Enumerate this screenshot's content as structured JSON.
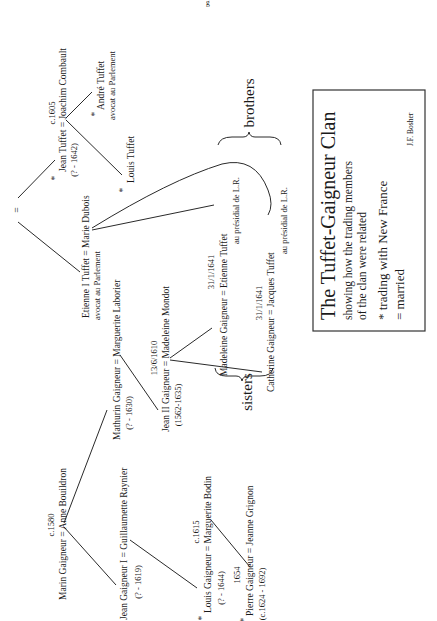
{
  "page_marker": "g",
  "legend": {
    "title": "The Tuffet-Gaigneur Clan",
    "subtitle_line1": "showing how the trading members",
    "subtitle_line2": "of the clan were related",
    "key_trading": "* trading with New France",
    "key_married": "= married",
    "author": "J.F. Bosher"
  },
  "symbols": {
    "marriage_equals": "=",
    "trader_star": "*"
  },
  "brackets": {
    "brothers": "brothers",
    "sisters": "sisters"
  },
  "people": {
    "jean_tuffet": {
      "date": "c.1605",
      "name": "Jean Tuffet = Joachim Combault",
      "dates": "(? - 1642)"
    },
    "andre_tuffet": {
      "name": "André Tuffet",
      "role": "avocat au Parlement"
    },
    "louis_tuffet": {
      "name": "Louis Tuffet"
    },
    "etienne_i_tuffet": {
      "name": "Etienne I Tuffet = Marie Dubois",
      "role": "avocat au Parlement"
    },
    "mathurin_gaigneur": {
      "name": "Mathurin Gaigneur = Marguerite Laborier",
      "dates": "(? - 1630)"
    },
    "jean_ii_gaigneur": {
      "date": "13/6/1610",
      "name": "Jean II Gaigneur = Madeleine Mondot",
      "dates": "(1562-1635)"
    },
    "madeleine_gaigneur": {
      "date": "31/1/1641",
      "name": "Madeleine Gaigneur = Etienne Tuffet",
      "role": "au présidial de L.R."
    },
    "catherine_gaigneur": {
      "date": "31/1/1641",
      "name": "Catherine Gaigneur = Jacques Tuffet",
      "role": "au présidial de L.R."
    },
    "marin_gaigneur": {
      "date": "c.1580",
      "name": "Marin Gaigneur = Anne Bouildron"
    },
    "jean_gaigneur_i": {
      "name": "Jean Gaigneur I = Guillaumette Raynier",
      "dates": "(? - 1619)"
    },
    "louis_gaigneur": {
      "date": "c.1615",
      "name": "Louis Gaigneur = Marguerite Bodin",
      "dates": "(? - 1644)"
    },
    "pierre_gaigneur": {
      "date": "1654",
      "name": "Pierre Gaigneur = Jeanne Grignon",
      "dates": "(c.1624 - 1692)"
    }
  }
}
